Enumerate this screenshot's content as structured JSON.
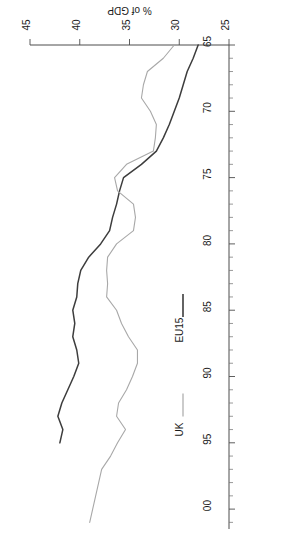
{
  "chart_data": {
    "type": "line",
    "title": "",
    "subtitle": "",
    "xlabel": "",
    "ylabel": "% of GDP",
    "xlim": [
      65,
      101.5
    ],
    "ylim": [
      25,
      45
    ],
    "grid": false,
    "rotation_degrees": 180,
    "orientation_note": "chart printed sideways and upside-down on page",
    "legend_position": "below-axis",
    "x_tick_labels": [
      "65",
      "70",
      "75",
      "80",
      "85",
      "90",
      "95",
      "00"
    ],
    "x_tick_values": [
      65,
      70,
      75,
      80,
      85,
      90,
      95,
      100
    ],
    "x_minor_tick_step": 1,
    "y_tick_labels": [
      "25",
      "30",
      "35",
      "40",
      "45"
    ],
    "y_tick_values": [
      25,
      30,
      35,
      40,
      45
    ],
    "colors": {
      "eu15": "#3d3d3d",
      "uk": "#a8a8a8",
      "axis": "#4d4d4d",
      "text": "#1a1a1a",
      "background": "#ffffff"
    },
    "x": [
      65,
      66,
      67,
      68,
      69,
      70,
      71,
      72,
      73,
      74,
      75,
      76,
      77,
      78,
      79,
      80,
      81,
      82,
      83,
      84,
      85,
      86,
      87,
      88,
      89,
      90,
      91,
      92,
      93,
      94,
      95,
      96,
      97,
      98,
      99,
      100,
      101
    ],
    "series": [
      {
        "name": "EU15",
        "color": "#3d3d3d",
        "x": [
          65,
          66,
          67,
          68,
          69,
          70,
          71,
          72,
          73,
          74,
          75,
          76,
          77,
          78,
          79,
          80,
          81,
          82,
          83,
          84,
          85,
          86,
          87,
          88,
          89,
          90,
          91,
          92,
          93,
          94,
          95
        ],
        "values": [
          28.1,
          28.6,
          29.2,
          29.6,
          30.0,
          30.5,
          31.0,
          31.6,
          32.3,
          33.8,
          35.6,
          36.0,
          36.3,
          36.7,
          37.0,
          37.9,
          39.1,
          39.9,
          40.2,
          40.3,
          40.7,
          40.5,
          40.7,
          40.3,
          40.1,
          40.6,
          41.2,
          41.8,
          42.2,
          41.7,
          42.0
        ]
      },
      {
        "name": "UK",
        "color": "#a8a8a8",
        "x": [
          65,
          66,
          67,
          68,
          69,
          70,
          71,
          72,
          73,
          74,
          75,
          76,
          77,
          78,
          79,
          80,
          81,
          82,
          83,
          84,
          85,
          86,
          87,
          88,
          89,
          90,
          91,
          92,
          93,
          94,
          95,
          96,
          97,
          98,
          99,
          100,
          101
        ],
        "values": [
          30.5,
          31.6,
          33.2,
          33.6,
          33.8,
          32.9,
          32.3,
          32.4,
          32.6,
          35.3,
          36.5,
          36.2,
          34.6,
          34.4,
          34.6,
          36.3,
          37.2,
          37.3,
          37.2,
          37.3,
          36.3,
          35.8,
          35.1,
          34.2,
          34.2,
          34.7,
          35.3,
          36.1,
          36.3,
          35.4,
          36.2,
          36.9,
          37.8,
          38.1,
          38.4,
          38.7,
          39.0
        ]
      }
    ]
  },
  "legend": {
    "items": [
      {
        "label": "EU15",
        "color": "#3d3d3d"
      },
      {
        "label": "UK",
        "color": "#a8a8a8"
      }
    ]
  },
  "axes": {
    "y_title": "% of GDP"
  }
}
